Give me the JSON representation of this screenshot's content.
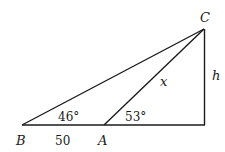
{
  "diagram": {
    "type": "geometry-triangle",
    "points": {
      "B": {
        "label": "B",
        "x": 22,
        "y": 125
      },
      "A": {
        "label": "A",
        "x": 104,
        "y": 125
      },
      "D": {
        "x": 205,
        "y": 125
      },
      "C": {
        "label": "C",
        "x": 204,
        "y": 29
      }
    },
    "segments": [
      {
        "from": "B",
        "to": "D"
      },
      {
        "from": "B",
        "to": "C"
      },
      {
        "from": "A",
        "to": "C"
      },
      {
        "from": "C",
        "to": "D"
      }
    ],
    "labels": {
      "vertex_B": "B",
      "vertex_A": "A",
      "vertex_C": "C",
      "side_BA": "50",
      "side_AC": "x",
      "side_height": "h",
      "angle_B": "46°",
      "angle_A": "53°"
    },
    "stroke_color": "#1a1a1a"
  }
}
